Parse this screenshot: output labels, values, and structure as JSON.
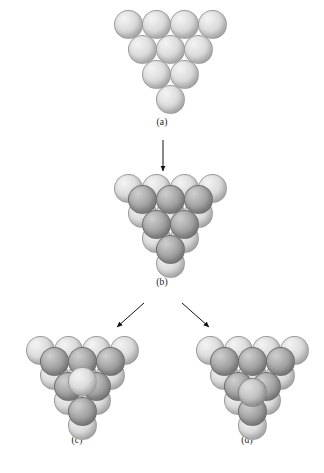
{
  "figure": {
    "background_color": "#ffffff",
    "width": 324,
    "height": 473,
    "sphere_colors": {
      "light": "#dcdcdc",
      "light_highlight": "#f4f4f4",
      "light_shadow": "#a9a9a9",
      "dark": "#a6a6a6",
      "dark_highlight": "#cfcfcf",
      "dark_shadow": "#6e6e6e",
      "outline": "#8c8c8c"
    },
    "arrow_color": "#121212"
  },
  "panels": [
    {
      "id": "a",
      "label": "(a)",
      "label_x": 162,
      "label_y": 124,
      "origin_x": 112,
      "origin_y": 8,
      "sphere_radius": 14.5,
      "description": "single close-packed layer of ten light spheres",
      "spheres": [
        {
          "cx": 16,
          "cy": 16,
          "r": 14.5,
          "shade": "light"
        },
        {
          "cx": 44,
          "cy": 16,
          "r": 14.5,
          "shade": "light"
        },
        {
          "cx": 72,
          "cy": 16,
          "r": 14.5,
          "shade": "light"
        },
        {
          "cx": 100,
          "cy": 16,
          "r": 14.5,
          "shade": "light"
        },
        {
          "cx": 30,
          "cy": 41,
          "r": 14.5,
          "shade": "light"
        },
        {
          "cx": 58,
          "cy": 41,
          "r": 14.5,
          "shade": "light"
        },
        {
          "cx": 86,
          "cy": 41,
          "r": 14.5,
          "shade": "light"
        },
        {
          "cx": 44,
          "cy": 66,
          "r": 14.5,
          "shade": "light"
        },
        {
          "cx": 72,
          "cy": 66,
          "r": 14.5,
          "shade": "light"
        },
        {
          "cx": 58,
          "cy": 91,
          "r": 14.5,
          "shade": "light"
        }
      ]
    },
    {
      "id": "b",
      "label": "(b)",
      "label_x": 162,
      "label_y": 284,
      "origin_x": 112,
      "origin_y": 172,
      "sphere_radius": 14.5,
      "description": "second layer of six darker spheres resting in the hollows of the first layer",
      "spheres": [
        {
          "cx": 16,
          "cy": 16,
          "r": 14.5,
          "shade": "light"
        },
        {
          "cx": 44,
          "cy": 16,
          "r": 14.5,
          "shade": "light"
        },
        {
          "cx": 72,
          "cy": 16,
          "r": 14.5,
          "shade": "light"
        },
        {
          "cx": 100,
          "cy": 16,
          "r": 14.5,
          "shade": "light"
        },
        {
          "cx": 30,
          "cy": 41,
          "r": 14.5,
          "shade": "light"
        },
        {
          "cx": 58,
          "cy": 41,
          "r": 14.5,
          "shade": "light"
        },
        {
          "cx": 86,
          "cy": 41,
          "r": 14.5,
          "shade": "light"
        },
        {
          "cx": 44,
          "cy": 66,
          "r": 14.5,
          "shade": "light"
        },
        {
          "cx": 72,
          "cy": 66,
          "r": 14.5,
          "shade": "light"
        },
        {
          "cx": 58,
          "cy": 91,
          "r": 14.5,
          "shade": "light"
        },
        {
          "cx": 30,
          "cy": 27,
          "r": 14.5,
          "shade": "dark"
        },
        {
          "cx": 58,
          "cy": 27,
          "r": 14.5,
          "shade": "dark"
        },
        {
          "cx": 86,
          "cy": 27,
          "r": 14.5,
          "shade": "dark"
        },
        {
          "cx": 44,
          "cy": 52,
          "r": 14.5,
          "shade": "dark"
        },
        {
          "cx": 72,
          "cy": 52,
          "r": 14.5,
          "shade": "dark"
        },
        {
          "cx": 58,
          "cy": 77,
          "r": 14.5,
          "shade": "dark"
        }
      ]
    },
    {
      "id": "c",
      "label": "(c)",
      "label_x": 77,
      "label_y": 442,
      "origin_x": 24,
      "origin_y": 334,
      "sphere_radius": 14.5,
      "description": "third layer sphere placed directly above a first layer sphere, hexagonal close packing ABA",
      "spheres": [
        {
          "cx": 16,
          "cy": 16,
          "r": 14.5,
          "shade": "light"
        },
        {
          "cx": 44,
          "cy": 16,
          "r": 14.5,
          "shade": "light"
        },
        {
          "cx": 72,
          "cy": 16,
          "r": 14.5,
          "shade": "light"
        },
        {
          "cx": 100,
          "cy": 16,
          "r": 14.5,
          "shade": "light"
        },
        {
          "cx": 30,
          "cy": 41,
          "r": 14.5,
          "shade": "light"
        },
        {
          "cx": 58,
          "cy": 41,
          "r": 14.5,
          "shade": "light"
        },
        {
          "cx": 86,
          "cy": 41,
          "r": 14.5,
          "shade": "light"
        },
        {
          "cx": 44,
          "cy": 66,
          "r": 14.5,
          "shade": "light"
        },
        {
          "cx": 72,
          "cy": 66,
          "r": 14.5,
          "shade": "light"
        },
        {
          "cx": 58,
          "cy": 91,
          "r": 14.5,
          "shade": "light"
        },
        {
          "cx": 30,
          "cy": 27,
          "r": 14.5,
          "shade": "dark"
        },
        {
          "cx": 58,
          "cy": 27,
          "r": 14.5,
          "shade": "dark"
        },
        {
          "cx": 86,
          "cy": 27,
          "r": 14.5,
          "shade": "dark"
        },
        {
          "cx": 44,
          "cy": 52,
          "r": 14.5,
          "shade": "dark"
        },
        {
          "cx": 72,
          "cy": 52,
          "r": 14.5,
          "shade": "dark"
        },
        {
          "cx": 58,
          "cy": 77,
          "r": 14.5,
          "shade": "dark"
        },
        {
          "cx": 58,
          "cy": 47,
          "r": 14.5,
          "shade": "light"
        }
      ]
    },
    {
      "id": "d",
      "label": "(d)",
      "label_x": 247,
      "label_y": 442,
      "origin_x": 194,
      "origin_y": 334,
      "sphere_radius": 14.5,
      "description": "third layer sphere placed over a different hollow, cubic close packing ABC",
      "spheres": [
        {
          "cx": 16,
          "cy": 16,
          "r": 14.5,
          "shade": "light"
        },
        {
          "cx": 44,
          "cy": 16,
          "r": 14.5,
          "shade": "light"
        },
        {
          "cx": 72,
          "cy": 16,
          "r": 14.5,
          "shade": "light"
        },
        {
          "cx": 100,
          "cy": 16,
          "r": 14.5,
          "shade": "light"
        },
        {
          "cx": 30,
          "cy": 41,
          "r": 14.5,
          "shade": "light"
        },
        {
          "cx": 58,
          "cy": 41,
          "r": 14.5,
          "shade": "light"
        },
        {
          "cx": 86,
          "cy": 41,
          "r": 14.5,
          "shade": "light"
        },
        {
          "cx": 44,
          "cy": 66,
          "r": 14.5,
          "shade": "light"
        },
        {
          "cx": 72,
          "cy": 66,
          "r": 14.5,
          "shade": "light"
        },
        {
          "cx": 58,
          "cy": 91,
          "r": 14.5,
          "shade": "light"
        },
        {
          "cx": 30,
          "cy": 27,
          "r": 14.5,
          "shade": "dark"
        },
        {
          "cx": 58,
          "cy": 27,
          "r": 14.5,
          "shade": "dark"
        },
        {
          "cx": 86,
          "cy": 27,
          "r": 14.5,
          "shade": "dark"
        },
        {
          "cx": 44,
          "cy": 52,
          "r": 14.5,
          "shade": "dark"
        },
        {
          "cx": 72,
          "cy": 52,
          "r": 14.5,
          "shade": "dark"
        },
        {
          "cx": 58,
          "cy": 77,
          "r": 14.5,
          "shade": "dark"
        },
        {
          "cx": 58,
          "cy": 58,
          "r": 14.5,
          "shade": "mid"
        }
      ]
    }
  ],
  "arrows": [
    {
      "id": "a-to-b",
      "x1": 163,
      "y1": 140,
      "x2": 163,
      "y2": 171
    },
    {
      "id": "b-to-c",
      "x1": 144,
      "y1": 303,
      "x2": 117,
      "y2": 327
    },
    {
      "id": "b-to-d",
      "x1": 182,
      "y1": 303,
      "x2": 209,
      "y2": 327
    }
  ]
}
